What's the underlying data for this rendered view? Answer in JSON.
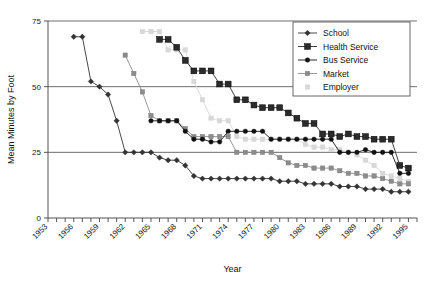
{
  "chart_data": {
    "type": "line",
    "title": "",
    "xlabel": "Year",
    "ylabel": "Mean Minutes by Foot",
    "xlim": [
      1953,
      1996
    ],
    "ylim": [
      0,
      75
    ],
    "yticks": [
      0,
      25,
      50,
      75
    ],
    "xticks": [
      1953,
      1954,
      1955,
      1956,
      1957,
      1958,
      1959,
      1960,
      1961,
      1962,
      1963,
      1964,
      1965,
      1966,
      1967,
      1968,
      1969,
      1970,
      1971,
      1972,
      1973,
      1974,
      1975,
      1976,
      1977,
      1978,
      1979,
      1980,
      1981,
      1982,
      1983,
      1984,
      1985,
      1986,
      1987,
      1988,
      1989,
      1990,
      1991,
      1992,
      1993,
      1994,
      1995,
      1996
    ],
    "xtick_labels": [
      "1953",
      "",
      "",
      "1956",
      "",
      "",
      "1959",
      "",
      "",
      "1962",
      "",
      "",
      "1965",
      "",
      "",
      "1968",
      "",
      "",
      "1971",
      "",
      "",
      "1974",
      "",
      "",
      "1977",
      "",
      "",
      "1980",
      "",
      "",
      "1983",
      "",
      "",
      "1986",
      "",
      "",
      "1989",
      "",
      "",
      "1992",
      "",
      "",
      "1995",
      ""
    ],
    "grid": "horizontal",
    "legend_position": "top-right",
    "series": [
      {
        "name": "School",
        "marker": "diamond",
        "color": "#333333",
        "points": [
          [
            1956,
            69
          ],
          [
            1957,
            69
          ],
          [
            1958,
            52
          ],
          [
            1959,
            50
          ],
          [
            1960,
            47
          ],
          [
            1961,
            37
          ],
          [
            1962,
            25
          ],
          [
            1963,
            25
          ],
          [
            1964,
            25
          ],
          [
            1965,
            25
          ],
          [
            1966,
            23
          ],
          [
            1967,
            22
          ],
          [
            1968,
            22
          ],
          [
            1969,
            20
          ],
          [
            1970,
            16
          ],
          [
            1971,
            15
          ],
          [
            1972,
            15
          ],
          [
            1973,
            15
          ],
          [
            1974,
            15
          ],
          [
            1975,
            15
          ],
          [
            1976,
            15
          ],
          [
            1977,
            15
          ],
          [
            1978,
            15
          ],
          [
            1979,
            15
          ],
          [
            1980,
            14
          ],
          [
            1981,
            14
          ],
          [
            1982,
            14
          ],
          [
            1983,
            13
          ],
          [
            1984,
            13
          ],
          [
            1985,
            13
          ],
          [
            1986,
            13
          ],
          [
            1987,
            12
          ],
          [
            1988,
            12
          ],
          [
            1989,
            12
          ],
          [
            1990,
            11
          ],
          [
            1991,
            11
          ],
          [
            1992,
            11
          ],
          [
            1993,
            10
          ],
          [
            1994,
            10
          ],
          [
            1995,
            10
          ]
        ]
      },
      {
        "name": "Health Service",
        "marker": "square",
        "color": "#2b2b2b",
        "points": [
          [
            1966,
            68
          ],
          [
            1967,
            68
          ],
          [
            1968,
            65
          ],
          [
            1969,
            60
          ],
          [
            1970,
            56
          ],
          [
            1971,
            56
          ],
          [
            1972,
            56
          ],
          [
            1973,
            51
          ],
          [
            1974,
            51
          ],
          [
            1975,
            45
          ],
          [
            1976,
            45
          ],
          [
            1977,
            43
          ],
          [
            1978,
            42
          ],
          [
            1979,
            42
          ],
          [
            1980,
            42
          ],
          [
            1981,
            40
          ],
          [
            1982,
            38
          ],
          [
            1983,
            36
          ],
          [
            1984,
            36
          ],
          [
            1985,
            32
          ],
          [
            1986,
            32
          ],
          [
            1987,
            31
          ],
          [
            1988,
            32
          ],
          [
            1989,
            31
          ],
          [
            1990,
            31
          ],
          [
            1991,
            30
          ],
          [
            1992,
            30
          ],
          [
            1993,
            30
          ],
          [
            1994,
            20
          ],
          [
            1995,
            19
          ]
        ]
      },
      {
        "name": "Bus Service",
        "marker": "circle",
        "color": "#111111",
        "points": [
          [
            1965,
            37
          ],
          [
            1966,
            37
          ],
          [
            1967,
            37
          ],
          [
            1968,
            37
          ],
          [
            1969,
            33
          ],
          [
            1970,
            30
          ],
          [
            1971,
            30
          ],
          [
            1972,
            29
          ],
          [
            1973,
            29
          ],
          [
            1974,
            33
          ],
          [
            1975,
            33
          ],
          [
            1976,
            33
          ],
          [
            1977,
            33
          ],
          [
            1978,
            33
          ],
          [
            1979,
            30
          ],
          [
            1980,
            30
          ],
          [
            1981,
            30
          ],
          [
            1982,
            30
          ],
          [
            1983,
            30
          ],
          [
            1984,
            30
          ],
          [
            1985,
            30
          ],
          [
            1986,
            30
          ],
          [
            1987,
            25
          ],
          [
            1988,
            25
          ],
          [
            1989,
            25
          ],
          [
            1990,
            26
          ],
          [
            1991,
            25
          ],
          [
            1992,
            25
          ],
          [
            1993,
            25
          ],
          [
            1994,
            17
          ],
          [
            1995,
            17
          ]
        ]
      },
      {
        "name": "Market",
        "marker": "square-small",
        "color": "#8c8c8c",
        "points": [
          [
            1962,
            62
          ],
          [
            1963,
            55
          ],
          [
            1964,
            48
          ],
          [
            1965,
            39
          ],
          [
            1966,
            37
          ],
          [
            1967,
            37
          ],
          [
            1968,
            37
          ],
          [
            1969,
            34
          ],
          [
            1970,
            31
          ],
          [
            1971,
            31
          ],
          [
            1972,
            31
          ],
          [
            1973,
            31
          ],
          [
            1974,
            31
          ],
          [
            1975,
            25
          ],
          [
            1976,
            25
          ],
          [
            1977,
            25
          ],
          [
            1978,
            25
          ],
          [
            1979,
            25
          ],
          [
            1980,
            23
          ],
          [
            1981,
            21
          ],
          [
            1982,
            20
          ],
          [
            1983,
            20
          ],
          [
            1984,
            19
          ],
          [
            1985,
            19
          ],
          [
            1986,
            19
          ],
          [
            1987,
            18
          ],
          [
            1988,
            17
          ],
          [
            1989,
            17
          ],
          [
            1990,
            16
          ],
          [
            1991,
            16
          ],
          [
            1992,
            15
          ],
          [
            1993,
            14
          ],
          [
            1994,
            13
          ],
          [
            1995,
            13
          ]
        ]
      },
      {
        "name": "Employer",
        "marker": "square-light",
        "color": "#d8d8d8",
        "points": [
          [
            1964,
            71
          ],
          [
            1965,
            71
          ],
          [
            1966,
            71
          ],
          [
            1967,
            64
          ],
          [
            1968,
            64
          ],
          [
            1969,
            64
          ],
          [
            1970,
            52
          ],
          [
            1971,
            45
          ],
          [
            1972,
            38
          ],
          [
            1973,
            37
          ],
          [
            1974,
            37
          ],
          [
            1975,
            31
          ],
          [
            1976,
            30
          ],
          [
            1977,
            30
          ],
          [
            1978,
            30
          ],
          [
            1979,
            30
          ],
          [
            1980,
            30
          ],
          [
            1981,
            30
          ],
          [
            1982,
            30
          ],
          [
            1983,
            28
          ],
          [
            1984,
            27
          ],
          [
            1985,
            27
          ],
          [
            1986,
            26
          ],
          [
            1987,
            26
          ],
          [
            1988,
            25
          ],
          [
            1989,
            24
          ],
          [
            1990,
            22
          ],
          [
            1991,
            20
          ],
          [
            1992,
            17
          ],
          [
            1993,
            16
          ],
          [
            1994,
            15
          ],
          [
            1995,
            14
          ]
        ]
      }
    ]
  },
  "legend": {
    "items": [
      {
        "label": "School"
      },
      {
        "label": "Health Service"
      },
      {
        "label": "Bus Service"
      },
      {
        "label": "Market"
      },
      {
        "label": "Employer"
      }
    ]
  }
}
